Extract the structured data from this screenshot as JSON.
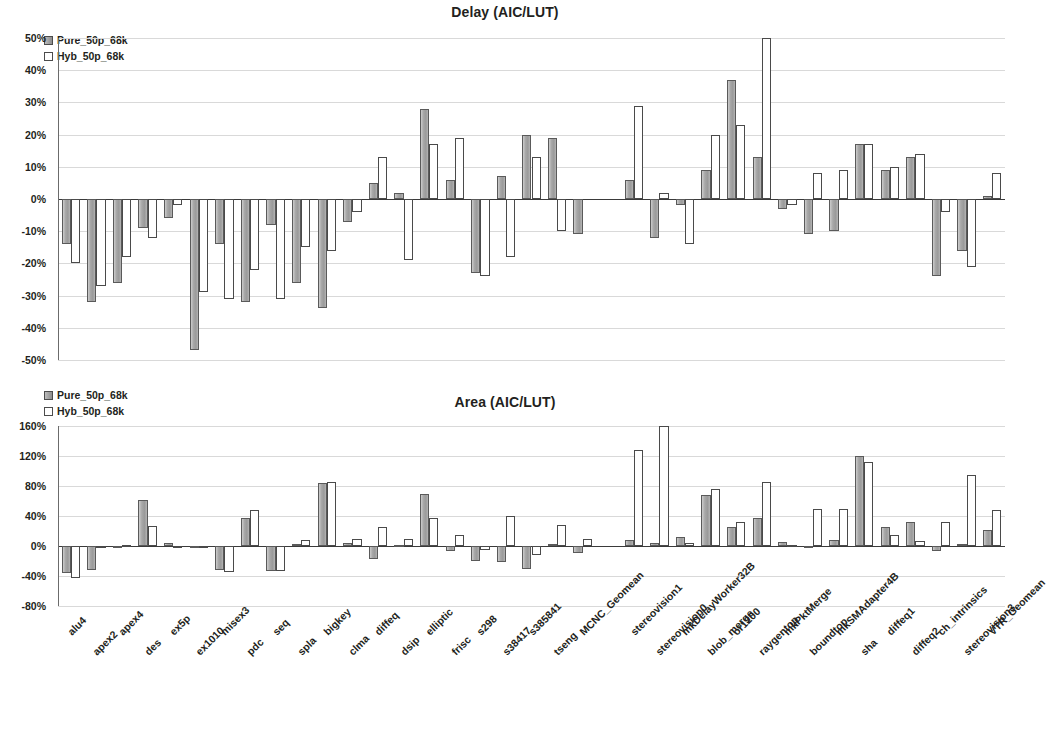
{
  "legend": {
    "pure_label": "Pure_50p_68k",
    "hyb_label": "Hyb_50p_68k"
  },
  "colors": {
    "pure_fill": "#a8a8a8",
    "hyb_fill": "#ffffff",
    "border": "#4a4a4a",
    "grid": "#d9d9d9",
    "axis": "#3a3a3a",
    "text": "#231f20"
  },
  "chart_data": [
    {
      "type": "bar",
      "title": "Delay (AIC/LUT)",
      "xlabel": "",
      "ylabel": "",
      "ylim": [
        -50,
        50
      ],
      "ytick_step": 10,
      "ytick_labels": [
        "50%",
        "40%",
        "30%",
        "20%",
        "10%",
        "0%",
        "-10%",
        "-20%",
        "-30%",
        "-40%",
        "-50%"
      ],
      "grid": true,
      "legend_position": "top-left",
      "legend": [
        "Pure_50p_68k",
        "Hyb_50p_68k"
      ],
      "categories": [
        "alu4",
        "apex2",
        "apex4",
        "des",
        "ex5p",
        "ex1010",
        "misex3",
        "pdc",
        "seq",
        "spla",
        "bigkey",
        "clma",
        "diffeq",
        "dsip",
        "elliptic",
        "frisc",
        "s298",
        "s38417",
        "s385841",
        "tseng",
        "MCNC_Geomean",
        "GAP",
        "stereovision1",
        "stereovision0",
        "mkDelayWorker32B",
        "blob_merge",
        "or1200",
        "raygentop",
        "mkPktMerge",
        "boundtop",
        "mkSMAdapter4B",
        "sha",
        "diffeq1",
        "diffeq2",
        "ch_intrinsics",
        "stereovision3",
        "VTR_Geomean"
      ],
      "series": [
        {
          "name": "Pure_50p_68k",
          "values": [
            -14,
            -32,
            -26,
            -9,
            -6,
            -47,
            -14,
            -32,
            -8,
            -26,
            -34,
            -7,
            5,
            2,
            28,
            6,
            -23,
            7,
            20,
            19,
            -11,
            null,
            6,
            -12,
            -2,
            9,
            37,
            13,
            -3,
            -11,
            -10,
            17,
            9,
            13,
            -24,
            -16,
            1
          ]
        },
        {
          "name": "Hyb_50p_68k",
          "values": [
            -20,
            -27,
            -18,
            -12,
            -2,
            -29,
            -31,
            -22,
            -31,
            -15,
            -16,
            -4,
            13,
            -19,
            17,
            19,
            -24,
            -18,
            13,
            -10,
            null,
            null,
            29,
            2,
            -14,
            20,
            23,
            50,
            -2,
            8,
            9,
            17,
            10,
            14,
            -4,
            -21,
            8
          ]
        }
      ]
    },
    {
      "type": "bar",
      "title": "Area (AIC/LUT)",
      "xlabel": "",
      "ylabel": "",
      "ylim": [
        -80,
        160
      ],
      "ytick_step": 40,
      "ytick_labels": [
        "160%",
        "120%",
        "80%",
        "40%",
        "0%",
        "-40%",
        "-80%"
      ],
      "grid": true,
      "legend_position": "top-left",
      "legend": [
        "Pure_50p_68k",
        "Hyb_50p_68k"
      ],
      "categories": [
        "alu4",
        "apex2",
        "apex4",
        "des",
        "ex5p",
        "ex1010",
        "misex3",
        "pdc",
        "seq",
        "spla",
        "bigkey",
        "clma",
        "diffeq",
        "dsip",
        "elliptic",
        "frisc",
        "s298",
        "s38417",
        "s385841",
        "tseng",
        "MCNC_Geomean",
        "GAP",
        "stereovision1",
        "stereovision0",
        "mkDelayWorker32B",
        "blob_merge",
        "or1200",
        "raygentop",
        "mkPktMerge",
        "boundtop",
        "mkSMAdapter4B",
        "sha",
        "diffeq1",
        "diffeq2",
        "ch_intrinsics",
        "stereovision3",
        "VTR_Geomean"
      ],
      "series": [
        {
          "name": "Pure_50p_68k",
          "values": [
            -36,
            -32,
            -3,
            62,
            4,
            -1,
            -32,
            38,
            -33,
            3,
            84,
            4,
            -17,
            2,
            70,
            -7,
            -20,
            -21,
            -30,
            3,
            -9,
            null,
            8,
            4,
            12,
            68,
            25,
            38,
            5,
            -3,
            8,
            120,
            25,
            32,
            -6,
            3,
            21
          ]
        },
        {
          "name": "Hyb_50p_68k",
          "values": [
            -42,
            -2,
            2,
            27,
            -2,
            -1,
            -35,
            48,
            -33,
            8,
            86,
            9,
            26,
            10,
            37,
            15,
            -5,
            40,
            -12,
            28,
            9,
            null,
            128,
            160,
            4,
            76,
            32,
            85,
            1,
            50,
            50,
            112,
            15,
            7,
            32,
            95,
            48
          ]
        }
      ]
    }
  ]
}
